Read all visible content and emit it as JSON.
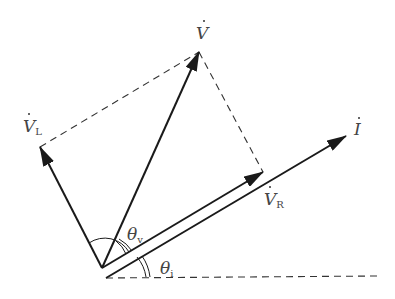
{
  "diagram": {
    "type": "phasor-diagram",
    "stroke_color": "#1a1a1a",
    "label_color": "#444444",
    "vectors": [
      {
        "id": "V",
        "label": "V",
        "subscript": "",
        "dot": true
      },
      {
        "id": "VL",
        "label": "V",
        "subscript": "L",
        "dot": true
      },
      {
        "id": "VR",
        "label": "V",
        "subscript": "R",
        "dot": true
      },
      {
        "id": "I",
        "label": "I",
        "subscript": "",
        "dot": true
      }
    ],
    "angles": [
      {
        "id": "theta_v",
        "label": "θ",
        "subscript": "v"
      },
      {
        "id": "theta_i",
        "label": "θ",
        "subscript": "i"
      }
    ]
  }
}
